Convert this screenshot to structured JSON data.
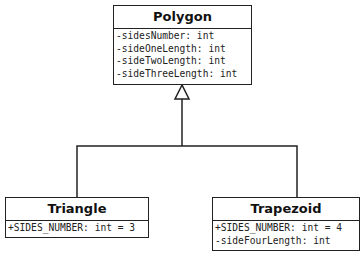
{
  "diagram": {
    "type": "uml-class-diagram",
    "classes": [
      {
        "name": "Polygon",
        "attributes": [
          "-sidesNumber: int",
          "-sideOneLength: int",
          "-sideTwoLength: int",
          "-sideThreeLength: int"
        ]
      },
      {
        "name": "Triangle",
        "attributes": [
          "+SIDES_NUMBER: int = 3"
        ]
      },
      {
        "name": "Trapezoid",
        "attributes": [
          "+SIDES_NUMBER: int = 4",
          "-sideFourLength: int"
        ]
      }
    ],
    "relationships": [
      {
        "type": "generalization",
        "from": "Triangle",
        "to": "Polygon"
      },
      {
        "type": "generalization",
        "from": "Trapezoid",
        "to": "Polygon"
      }
    ],
    "colors": {
      "line": "#222222",
      "background": "#ffffff"
    }
  }
}
